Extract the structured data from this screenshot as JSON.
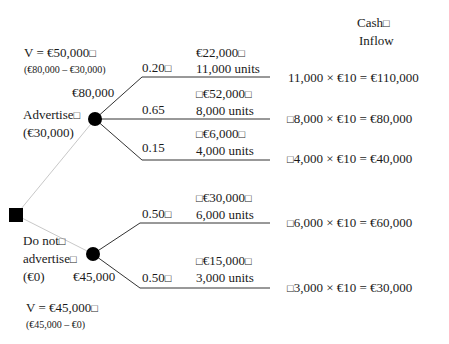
{
  "header": {
    "cash_inflow_line1": "Cash",
    "cash_inflow_line2": "Inflow"
  },
  "decision": {
    "advertise": {
      "label": "Advertise",
      "cost": "(€30,000)",
      "node_value": "€80,000",
      "net_value": "V = €50,000",
      "net_calc": "(€80,000 – €30,000)",
      "branches": [
        {
          "probability": "0.20",
          "payoff": "€22,000",
          "units": "11,000 units",
          "cash_inflow": "11,000 × €10 = €110,000"
        },
        {
          "probability": "0.65",
          "payoff": "€52,000",
          "units": "8,000 units",
          "cash_inflow": "8,000 × €10 = €80,000"
        },
        {
          "probability": "0.15",
          "payoff": "€6,000",
          "units": "4,000 units",
          "cash_inflow": "4,000 × €10 = €40,000"
        }
      ]
    },
    "do_not_advertise": {
      "label_line1": "Do not",
      "label_line2": "advertise",
      "cost": "(€0)",
      "node_value": "€45,000",
      "net_value": "V = €45,000",
      "net_calc": "(€45,000 – €0)",
      "branches": [
        {
          "probability": "0.50",
          "payoff": "€30,000",
          "units": "6,000 units",
          "cash_inflow": "6,000 × €10 = €60,000"
        },
        {
          "probability": "0.50",
          "payoff": "€15,000",
          "units": "3,000 units",
          "cash_inflow": "3,000 × €10 = €30,000"
        }
      ]
    }
  },
  "colors": {
    "ink": "#1a1a1a",
    "faint_line": "#c8c8c8"
  }
}
